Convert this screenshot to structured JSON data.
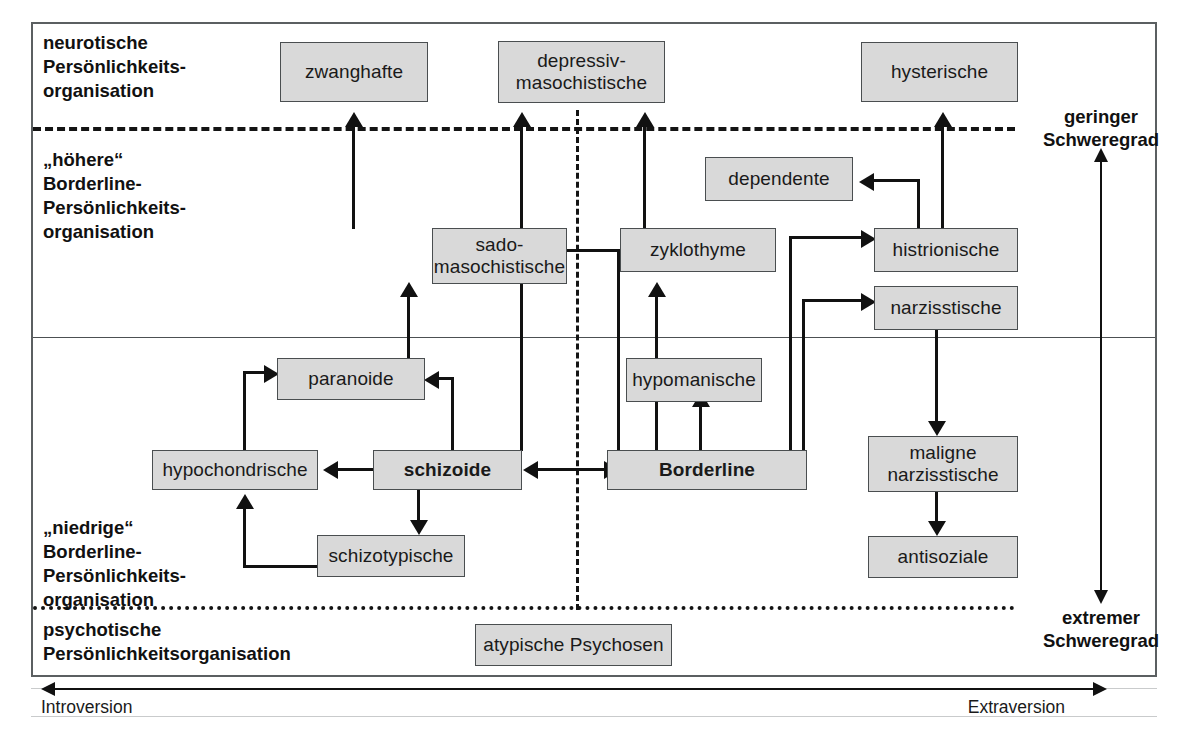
{
  "diagram": {
    "colors": {
      "node_fill": "#d9d9d9",
      "node_border": "#4a4e50",
      "line": "#111111",
      "frame": "#5b5f61"
    },
    "regions": [
      {
        "id": "neurotic",
        "label": "neurotische\nPersönlichkeits-\norganisation"
      },
      {
        "id": "high-borderline",
        "label": "„höhere“\nBorderline-\nPersönlichkeits-\norganisation"
      },
      {
        "id": "low-borderline",
        "label": "„niedrige“\nBorderline-\nPersönlichkeits-\norganisation"
      },
      {
        "id": "psychotic",
        "label": "psychotische\nPersönlichkeitsorganisation"
      }
    ],
    "severity_axis": {
      "top_label": "geringer\nSchweregrad",
      "bottom_label": "extremer\nSchweregrad"
    },
    "horizontal_axis": {
      "left_label": "Introversion",
      "right_label": "Extraversion"
    },
    "nodes": [
      {
        "id": "zwanghafte",
        "label": "zwanghafte",
        "bold": false
      },
      {
        "id": "depressiv",
        "label": "depressiv-\nmasochistische",
        "bold": false
      },
      {
        "id": "hysterische",
        "label": "hysterische",
        "bold": false
      },
      {
        "id": "dependente",
        "label": "dependente",
        "bold": false
      },
      {
        "id": "sado",
        "label": "sado-\nmasochistische",
        "bold": false
      },
      {
        "id": "zyklothyme",
        "label": "zyklothyme",
        "bold": false
      },
      {
        "id": "histrionische",
        "label": "histrionische",
        "bold": false
      },
      {
        "id": "narzisstische",
        "label": "narzisstische",
        "bold": false
      },
      {
        "id": "paranoide",
        "label": "paranoide",
        "bold": false
      },
      {
        "id": "hypomanische",
        "label": "hypomanische",
        "bold": false
      },
      {
        "id": "hypochondrische",
        "label": "hypochondrische",
        "bold": false
      },
      {
        "id": "schizoide",
        "label": "schizoide",
        "bold": true
      },
      {
        "id": "borderline",
        "label": "Borderline",
        "bold": true
      },
      {
        "id": "maligne",
        "label": "maligne\nnarzisstische",
        "bold": false
      },
      {
        "id": "schizotypische",
        "label": "schizotypische",
        "bold": false
      },
      {
        "id": "antisoziale",
        "label": "antisoziale",
        "bold": false
      },
      {
        "id": "atypische",
        "label": "atypische Psychosen",
        "bold": false
      }
    ],
    "edges": [
      {
        "from": "sado",
        "to": "zwanghafte",
        "type": "arrow-up"
      },
      {
        "from": "paranoide",
        "to": "sado",
        "type": "arrow-up"
      },
      {
        "from": "borderline",
        "to": "depressiv",
        "type": "arrow-up"
      },
      {
        "from": "zyklothyme",
        "to": "depressiv",
        "type": "arrow-up"
      },
      {
        "from": "histrionische",
        "to": "hysterische",
        "type": "arrow-up"
      },
      {
        "from": "histrionische",
        "to": "dependente",
        "type": "arrow-left"
      },
      {
        "from": "borderline",
        "to": "zyklothyme",
        "type": "arrow-up"
      },
      {
        "from": "borderline",
        "to": "sado",
        "type": "arrow-left"
      },
      {
        "from": "borderline",
        "to": "histrionische",
        "type": "arrow-right"
      },
      {
        "from": "borderline",
        "to": "narzisstische",
        "type": "arrow-right"
      },
      {
        "from": "borderline",
        "to": "hypomanische",
        "type": "arrow-up"
      },
      {
        "from": "borderline",
        "to": "schizoide",
        "type": "arrow-double"
      },
      {
        "from": "schizoide",
        "to": "paranoide",
        "type": "arrow-left"
      },
      {
        "from": "schizoide",
        "to": "hypochondrische",
        "type": "arrow-left"
      },
      {
        "from": "schizoide",
        "to": "schizotypische",
        "type": "arrow-down"
      },
      {
        "from": "schizotypische",
        "to": "hypochondrische",
        "type": "arrow-up"
      },
      {
        "from": "hypochondrische",
        "to": "paranoide",
        "type": "arrow-right"
      },
      {
        "from": "narzisstische",
        "to": "maligne",
        "type": "arrow-down"
      },
      {
        "from": "maligne",
        "to": "antisoziale",
        "type": "arrow-down"
      }
    ]
  }
}
